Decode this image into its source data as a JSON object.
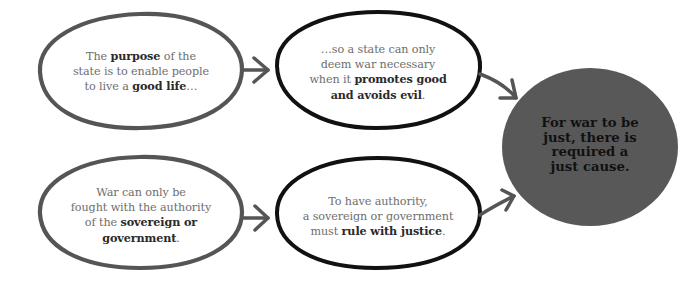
{
  "colors": {
    "background": "#ffffff",
    "gray_stroke": "#555555",
    "black_stroke": "#111111",
    "arrow": "#555555",
    "conclusion_fill": "#585858",
    "normal_text": "#6e6e6e",
    "bold_text": "#2a2a2a",
    "conclusion_text": "#111111"
  },
  "nodes": {
    "purpose": {
      "parts": [
        {
          "text": "The ",
          "bold": false
        },
        {
          "text": "purpose",
          "bold": true
        },
        {
          "text": " of the state is to enable people to live a ",
          "bold": false
        },
        {
          "text": "good life",
          "bold": true
        },
        {
          "text": "…",
          "bold": false
        }
      ],
      "line1_a": "The ",
      "line1_b": "purpose",
      "line1_c": " of the",
      "line2": "state is to enable people",
      "line3_a": "to live a ",
      "line3_b": "good life",
      "line3_c": "…"
    },
    "war_necessary": {
      "line1": "…so a state can only",
      "line2": "deem war necessary",
      "line3_a": "when it ",
      "line3_b": "promotes good",
      "line4_b": "and avoids evil",
      "line4_c": "."
    },
    "authority": {
      "line1": "War can only be",
      "line2": "fought with the authority",
      "line3_a": "of the ",
      "line3_b": "sovereign or",
      "line4_b": "government",
      "line4_c": "."
    },
    "justice": {
      "line1": "To have authority,",
      "line2": "a sovereign or government",
      "line3_a": "must ",
      "line3_b": "rule with justice",
      "line3_c": "."
    },
    "conclusion": {
      "line1": "For war to be",
      "line2": "just, there is",
      "line3": "required a",
      "line4": "just cause."
    }
  },
  "edges": [
    {
      "from": "purpose",
      "to": "war_necessary"
    },
    {
      "from": "war_necessary",
      "to": "conclusion"
    },
    {
      "from": "authority",
      "to": "justice"
    },
    {
      "from": "justice",
      "to": "conclusion"
    }
  ]
}
